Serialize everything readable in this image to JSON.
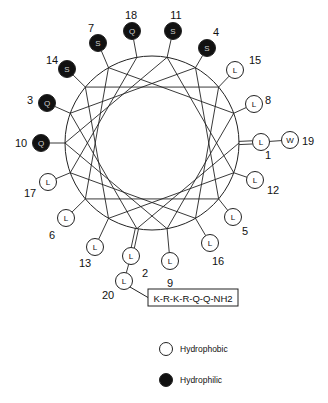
{
  "diagram": {
    "type": "helical-wheel",
    "center": [
      152,
      143
    ],
    "radius": 87,
    "angle_step_deg": 100,
    "colors": {
      "hydrophilic": "#111111",
      "hydrophobic": "#ffffff",
      "stroke": "#222222"
    },
    "residues": [
      {
        "pos": 1,
        "aa": "L",
        "type": "hydrophobic",
        "node": [
          261,
          142
        ],
        "label": [
          268,
          155
        ],
        "double_bond": true
      },
      {
        "pos": 2,
        "aa": "L",
        "type": "hydrophobic",
        "node": [
          131,
          256
        ],
        "label": [
          145,
          273
        ],
        "double_bond": true
      },
      {
        "pos": 3,
        "aa": "Q",
        "type": "hydrophilic",
        "node": [
          47,
          103
        ],
        "label": [
          30,
          100
        ]
      },
      {
        "pos": 4,
        "aa": "S",
        "type": "hydrophilic",
        "node": [
          207,
          48
        ],
        "label": [
          216,
          32
        ]
      },
      {
        "pos": 5,
        "aa": "L",
        "type": "hydrophobic",
        "node": [
          233,
          217
        ],
        "label": [
          245,
          231
        ]
      },
      {
        "pos": 6,
        "aa": "L",
        "type": "hydrophobic",
        "node": [
          66,
          218
        ],
        "label": [
          52,
          235
        ]
      },
      {
        "pos": 7,
        "aa": "S",
        "type": "hydrophilic",
        "node": [
          98,
          43
        ],
        "label": [
          91,
          28
        ]
      },
      {
        "pos": 8,
        "aa": "L",
        "type": "hydrophobic",
        "node": [
          254,
          104
        ],
        "label": [
          268,
          100
        ]
      },
      {
        "pos": 9,
        "aa": "L",
        "type": "hydrophobic",
        "node": [
          170,
          261
        ],
        "label": [
          170,
          283
        ]
      },
      {
        "pos": 10,
        "aa": "Q",
        "type": "hydrophilic",
        "node": [
          41,
          143
        ],
        "label": [
          21,
          143
        ]
      },
      {
        "pos": 11,
        "aa": "S",
        "type": "hydrophilic",
        "node": [
          173,
          31
        ],
        "label": [
          176,
          15
        ]
      },
      {
        "pos": 12,
        "aa": "L",
        "type": "hydrophobic",
        "node": [
          255,
          180
        ],
        "label": [
          273,
          190
        ]
      },
      {
        "pos": 13,
        "aa": "L",
        "type": "hydrophobic",
        "node": [
          95,
          247
        ],
        "label": [
          85,
          263
        ]
      },
      {
        "pos": 14,
        "aa": "S",
        "type": "hydrophilic",
        "node": [
          67,
          69
        ],
        "label": [
          52,
          60
        ]
      },
      {
        "pos": 15,
        "aa": "L",
        "type": "hydrophobic",
        "node": [
          235,
          70
        ],
        "label": [
          255,
          60
        ]
      },
      {
        "pos": 16,
        "aa": "L",
        "type": "hydrophobic",
        "node": [
          210,
          243
        ],
        "label": [
          218,
          261
        ]
      },
      {
        "pos": 17,
        "aa": "L",
        "type": "hydrophobic",
        "node": [
          48,
          182
        ],
        "label": [
          30,
          193
        ]
      },
      {
        "pos": 18,
        "aa": "Q",
        "type": "hydrophilic",
        "node": [
          132,
          31
        ],
        "label": [
          131,
          15
        ]
      },
      {
        "pos": 19,
        "aa": "W",
        "type": "hydrophobic",
        "node": [
          290,
          140
        ],
        "label": [
          308,
          141
        ],
        "attached_to": 1
      },
      {
        "pos": 20,
        "aa": "L",
        "type": "hydrophobic",
        "node": [
          124,
          281
        ],
        "label": [
          108,
          295
        ],
        "attached_to": 2
      }
    ],
    "terminal_sequence": {
      "text": "K-R-K-R-Q-Q-NH2",
      "box": [
        148,
        289,
        90,
        17
      ],
      "attached_to": 20
    },
    "legend": [
      {
        "label": "Hydrophobic",
        "type": "hydrophobic",
        "marker": [
          166,
          349
        ],
        "text": [
          180,
          349
        ]
      },
      {
        "label": "Hydrophilic",
        "type": "hydrophilic",
        "marker": [
          166,
          380
        ],
        "text": [
          180,
          380
        ]
      }
    ]
  }
}
